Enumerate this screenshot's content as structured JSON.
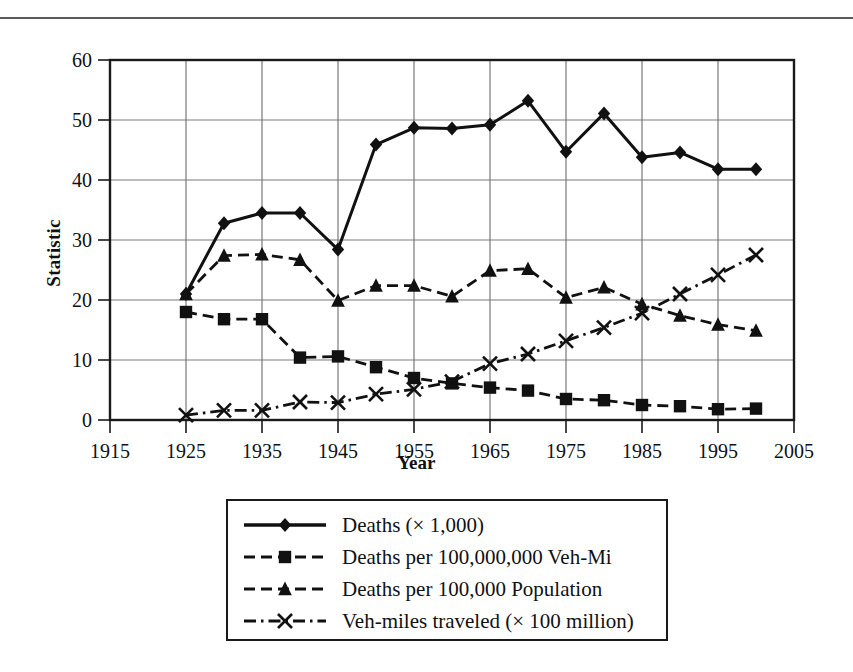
{
  "chart_data": {
    "type": "line",
    "title": "",
    "xlabel": "Year",
    "ylabel": "Statistic",
    "xlim": [
      1915,
      2005
    ],
    "ylim": [
      0,
      60
    ],
    "xticks": [
      1915,
      1925,
      1935,
      1945,
      1955,
      1965,
      1975,
      1985,
      1995,
      2005
    ],
    "yticks": [
      0,
      10,
      20,
      30,
      40,
      50,
      60
    ],
    "grid": true,
    "legend_position": "below-plot",
    "x": [
      1925,
      1930,
      1935,
      1940,
      1945,
      1950,
      1955,
      1960,
      1965,
      1970,
      1975,
      1980,
      1985,
      1990,
      1995,
      2000
    ],
    "series": [
      {
        "name": "Deaths (× 1,000)",
        "marker": "diamond",
        "line": "solid",
        "values": [
          21.0,
          32.8,
          34.5,
          34.5,
          28.4,
          45.9,
          48.7,
          48.6,
          49.2,
          53.2,
          44.7,
          51.1,
          43.8,
          44.6,
          41.8,
          41.8
        ]
      },
      {
        "name": "Deaths per 100,000,000 Veh-Mi",
        "marker": "square",
        "line": "dashed",
        "values": [
          18.0,
          16.8,
          16.8,
          10.4,
          10.6,
          8.8,
          7.0,
          6.1,
          5.4,
          4.9,
          3.5,
          3.3,
          2.5,
          2.3,
          1.8,
          1.9
        ]
      },
      {
        "name": "Deaths per 100,000 Population",
        "marker": "triangle",
        "line": "dashed",
        "values": [
          21.0,
          27.4,
          27.6,
          26.7,
          19.9,
          22.4,
          22.4,
          20.6,
          24.9,
          25.2,
          20.4,
          22.1,
          19.3,
          17.4,
          15.9,
          14.9
        ]
      },
      {
        "name": "Veh-miles traveled (× 100 million)",
        "marker": "cross",
        "line": "dash-dot",
        "values": [
          0.8,
          1.6,
          1.6,
          3.0,
          2.9,
          4.3,
          5.1,
          6.4,
          9.4,
          11.0,
          13.2,
          15.4,
          17.8,
          21.0,
          24.2,
          27.5
        ]
      }
    ]
  },
  "axis": {
    "ylabel": "Statistic",
    "xlabel": "Year",
    "x_tick_labels": [
      "1915",
      "1925",
      "1935",
      "1945",
      "1955",
      "1965",
      "1975",
      "1985",
      "1995",
      "2005"
    ],
    "y_tick_labels": [
      "0",
      "10",
      "20",
      "30",
      "40",
      "50",
      "60"
    ]
  },
  "legend": {
    "items": [
      {
        "label": "Deaths (× 1,000)",
        "marker": "diamond-marker",
        "line": "solid"
      },
      {
        "label": "Deaths per 100,000,000 Veh-Mi",
        "marker": "square-marker",
        "line": "dashed"
      },
      {
        "label": "Deaths per 100,000 Population",
        "marker": "triangle-marker",
        "line": "dashed"
      },
      {
        "label": "Veh-miles traveled (× 100 million)",
        "marker": "cross-marker",
        "line": "dash-dot"
      }
    ]
  },
  "colors": {
    "ink": "#111111",
    "grid": "#7a7a7a",
    "frame": "#1a1a1a",
    "rule": "#5a5a5a"
  }
}
